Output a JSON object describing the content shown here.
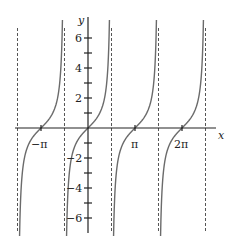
{
  "chart_data": {
    "type": "line",
    "title": "",
    "function": "y = tan(x)",
    "xlabel": "x",
    "ylabel": "y",
    "x_tick_labels": [
      "−π",
      "π",
      "2π"
    ],
    "x_ticks": [
      -3.14159,
      3.14159,
      6.28318
    ],
    "y_tick_labels": [
      "6",
      "4",
      "2",
      "−2",
      "−4",
      "−6"
    ],
    "y_ticks": [
      6,
      4,
      2,
      -2,
      -4,
      -6
    ],
    "y_minor_ticks": [
      5,
      3,
      1,
      -1,
      -3,
      -5
    ],
    "xlim": [
      -4.9,
      8.4
    ],
    "ylim": [
      -7,
      7.4
    ],
    "asymptotes": [
      -4.712,
      -1.571,
      1.571,
      4.712,
      7.854
    ],
    "grid": false,
    "legend": null,
    "series": [
      {
        "name": "tan(x)",
        "branches": [
          [
            -4.712,
            -1.571
          ],
          [
            -1.571,
            1.571
          ],
          [
            1.571,
            4.712
          ],
          [
            4.712,
            7.854
          ]
        ]
      }
    ],
    "colors": {
      "curve": "#6b6b6b",
      "axis": "#222222",
      "asymptote": "#555555"
    }
  },
  "labels": {
    "x_axis": "x",
    "y_axis": "y",
    "neg_pi": "−π",
    "pi": "π",
    "two_pi": "2π",
    "y6": "6",
    "y4": "4",
    "y2": "2",
    "yn2": "−2",
    "yn4": "−4",
    "yn6": "−6"
  }
}
